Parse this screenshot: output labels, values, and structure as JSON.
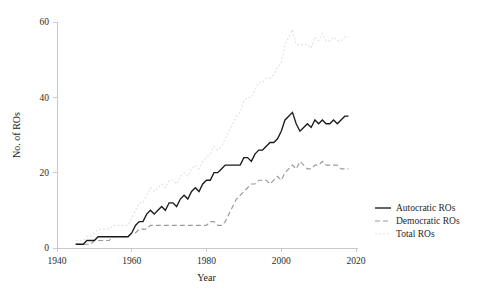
{
  "chart_data": {
    "type": "line",
    "title": "",
    "xlabel": "Year",
    "ylabel": "No. of ROs",
    "xlim": [
      1940,
      2020
    ],
    "ylim": [
      0,
      60
    ],
    "xticks": [
      1940,
      1960,
      1980,
      2000,
      2020
    ],
    "xtick_labels": [
      "1940",
      "1960",
      "1980",
      "2000",
      "2020"
    ],
    "yticks": [
      0,
      20,
      40,
      60
    ],
    "ytick_labels": [
      "0",
      "20",
      "40",
      "60"
    ],
    "grid": false,
    "legend_position": "right",
    "series": [
      {
        "name": "Autocratic ROs",
        "style": "solid",
        "color": "#1a1a1a",
        "x": [
          1945,
          1946,
          1947,
          1948,
          1949,
          1950,
          1951,
          1952,
          1953,
          1954,
          1955,
          1956,
          1957,
          1958,
          1959,
          1960,
          1961,
          1962,
          1963,
          1964,
          1965,
          1966,
          1967,
          1968,
          1969,
          1970,
          1971,
          1972,
          1973,
          1974,
          1975,
          1976,
          1977,
          1978,
          1979,
          1980,
          1981,
          1982,
          1983,
          1984,
          1985,
          1986,
          1987,
          1988,
          1989,
          1990,
          1991,
          1992,
          1993,
          1994,
          1995,
          1996,
          1997,
          1998,
          1999,
          2000,
          2001,
          2002,
          2003,
          2004,
          2005,
          2006,
          2007,
          2008,
          2009,
          2010,
          2011,
          2012,
          2013,
          2014,
          2015,
          2016,
          2017,
          2018
        ],
        "values": [
          1,
          1,
          1,
          2,
          2,
          2,
          3,
          3,
          3,
          3,
          3,
          3,
          3,
          3,
          3,
          4,
          6,
          7,
          7,
          9,
          10,
          9,
          10,
          11,
          10,
          12,
          12,
          11,
          13,
          14,
          13,
          15,
          16,
          15,
          17,
          18,
          18,
          20,
          20,
          21,
          22,
          22,
          22,
          22,
          22,
          24,
          24,
          23,
          25,
          26,
          26,
          27,
          28,
          28,
          29,
          31,
          34,
          35,
          36,
          33,
          31,
          32,
          33,
          32,
          34,
          33,
          34,
          33,
          33,
          34,
          33,
          34,
          35,
          35
        ]
      },
      {
        "name": "Democratic ROs",
        "style": "dashed",
        "color": "#9a9a9a",
        "x": [
          1945,
          1946,
          1947,
          1948,
          1949,
          1950,
          1951,
          1952,
          1953,
          1954,
          1955,
          1956,
          1957,
          1958,
          1959,
          1960,
          1961,
          1962,
          1963,
          1964,
          1965,
          1966,
          1967,
          1968,
          1969,
          1970,
          1971,
          1972,
          1973,
          1974,
          1975,
          1976,
          1977,
          1978,
          1979,
          1980,
          1981,
          1982,
          1983,
          1984,
          1985,
          1986,
          1987,
          1988,
          1989,
          1990,
          1991,
          1992,
          1993,
          1994,
          1995,
          1996,
          1997,
          1998,
          1999,
          2000,
          2001,
          2002,
          2003,
          2004,
          2005,
          2006,
          2007,
          2008,
          2009,
          2010,
          2011,
          2012,
          2013,
          2014,
          2015,
          2016,
          2017,
          2018
        ],
        "values": [
          1,
          1,
          1,
          1,
          1,
          2,
          2,
          2,
          2,
          2,
          3,
          3,
          3,
          3,
          3,
          4,
          4,
          5,
          5,
          5,
          6,
          6,
          6,
          6,
          6,
          6,
          6,
          6,
          6,
          6,
          6,
          6,
          6,
          6,
          6,
          6,
          7,
          7,
          6,
          6,
          7,
          9,
          11,
          13,
          14,
          15,
          16,
          17,
          17,
          18,
          18,
          18,
          17,
          18,
          19,
          18,
          20,
          21,
          22,
          21,
          23,
          22,
          21,
          21,
          22,
          22,
          23,
          22,
          22,
          22,
          22,
          21,
          21,
          21
        ]
      },
      {
        "name": "Total ROs",
        "style": "dotted",
        "color": "#e2e2e2",
        "x": [
          1945,
          1946,
          1947,
          1948,
          1949,
          1950,
          1951,
          1952,
          1953,
          1954,
          1955,
          1956,
          1957,
          1958,
          1959,
          1960,
          1961,
          1962,
          1963,
          1964,
          1965,
          1966,
          1967,
          1968,
          1969,
          1970,
          1971,
          1972,
          1973,
          1974,
          1975,
          1976,
          1977,
          1978,
          1979,
          1980,
          1981,
          1982,
          1983,
          1984,
          1985,
          1986,
          1987,
          1988,
          1989,
          1990,
          1991,
          1992,
          1993,
          1994,
          1995,
          1996,
          1997,
          1998,
          1999,
          2000,
          2001,
          2002,
          2003,
          2004,
          2005,
          2006,
          2007,
          2008,
          2009,
          2010,
          2011,
          2012,
          2013,
          2014,
          2015,
          2016,
          2017,
          2018
        ],
        "values": [
          2,
          2,
          2,
          3,
          3,
          4,
          5,
          5,
          5,
          5,
          6,
          6,
          6,
          6,
          6,
          8,
          10,
          12,
          12,
          14,
          16,
          15,
          16,
          17,
          16,
          18,
          18,
          17,
          19,
          20,
          19,
          21,
          22,
          21,
          23,
          24,
          25,
          27,
          26,
          27,
          29,
          31,
          33,
          35,
          36,
          39,
          40,
          40,
          42,
          44,
          44,
          45,
          45,
          46,
          48,
          49,
          54,
          56,
          58,
          54,
          54,
          54,
          54,
          53,
          56,
          55,
          57,
          55,
          55,
          56,
          55,
          55,
          56,
          56
        ]
      }
    ]
  },
  "legend": {
    "items": [
      {
        "label": "Autocratic ROs",
        "style": "solid",
        "color": "#1a1a1a"
      },
      {
        "label": "Democratic ROs",
        "style": "dashed",
        "color": "#9a9a9a"
      },
      {
        "label": "Total ROs",
        "style": "dotted",
        "color": "#e2e2e2"
      }
    ]
  }
}
